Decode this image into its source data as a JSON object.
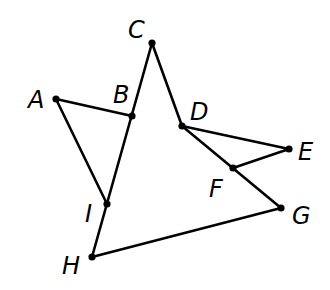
{
  "diagram": {
    "points": [
      {
        "name": "A",
        "label": "A"
      },
      {
        "name": "B",
        "label": "B"
      },
      {
        "name": "C",
        "label": "C"
      },
      {
        "name": "D",
        "label": "D"
      },
      {
        "name": "E",
        "label": "E"
      },
      {
        "name": "F",
        "label": "F"
      },
      {
        "name": "G",
        "label": "G"
      },
      {
        "name": "H",
        "label": "H"
      },
      {
        "name": "I",
        "label": "I"
      }
    ],
    "segments": [
      [
        "A",
        "B"
      ],
      [
        "A",
        "I"
      ],
      [
        "H",
        "C"
      ],
      [
        "C",
        "D"
      ],
      [
        "D",
        "E"
      ],
      [
        "E",
        "F"
      ],
      [
        "D",
        "G"
      ],
      [
        "G",
        "H"
      ]
    ]
  }
}
